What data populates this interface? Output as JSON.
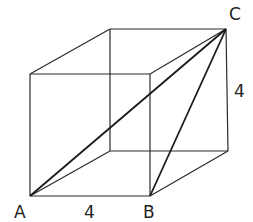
{
  "diagram": {
    "type": "cube",
    "vertices": {
      "front_bottom_left": [
        30,
        196
      ],
      "front_bottom_right": [
        150,
        196
      ],
      "front_top_left": [
        30,
        74
      ],
      "front_top_right": [
        150,
        74
      ],
      "back_bottom_left": [
        110,
        151
      ],
      "back_bottom_right": [
        228,
        151
      ],
      "back_top_left": [
        110,
        29
      ],
      "back_top_right": [
        226,
        29
      ]
    },
    "labels": {
      "A": "A",
      "B": "B",
      "C": "C",
      "edge_AB": "4",
      "edge_vertical": "4"
    },
    "diagonals": [
      "A-C",
      "B-C",
      "A-back_bottom_right"
    ]
  }
}
